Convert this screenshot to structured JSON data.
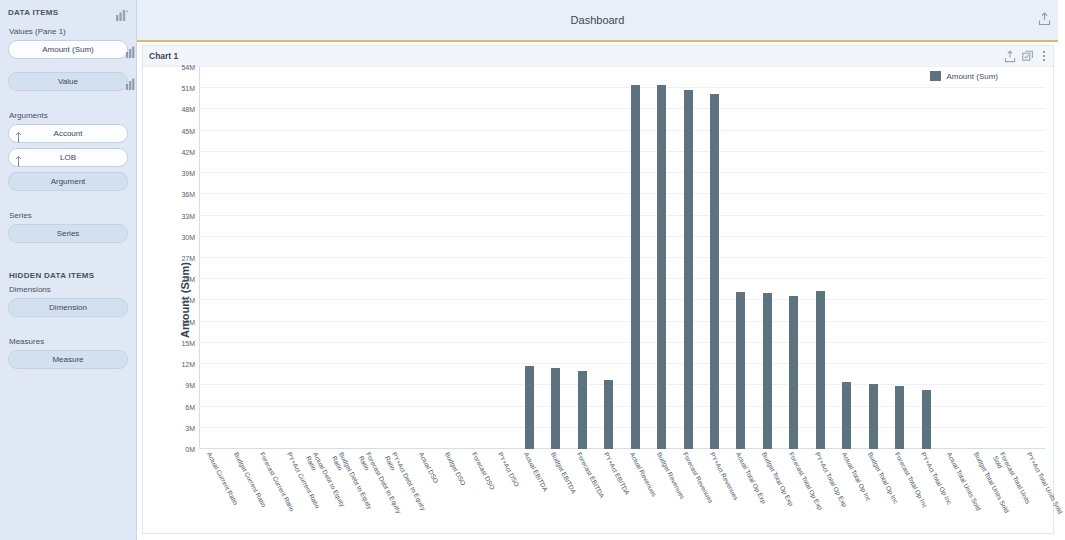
{
  "sidebar": {
    "title": "DATA ITEMS",
    "head_icon": "chart-bar-icon",
    "values_label": "Values (Pane 1)",
    "values_items": [
      {
        "label": "Amount (Sum)",
        "style": "filled",
        "icon": "chart-bar-icon"
      },
      {
        "label": "Value",
        "style": "ghost",
        "icon": "chart-bar-icon"
      }
    ],
    "arguments_label": "Arguments",
    "arguments_items": [
      {
        "label": "Account",
        "icon": "sort-asc-icon"
      },
      {
        "label": "LOB",
        "icon": "sort-asc-icon"
      }
    ],
    "arguments_placeholder": "Argument",
    "series_label": "Series",
    "series_placeholder": "Series",
    "hidden_title": "HIDDEN DATA ITEMS",
    "dimensions_label": "Dimensions",
    "dimensions_placeholder": "Dimension",
    "measures_label": "Measures",
    "measures_placeholder": "Measure"
  },
  "header": {
    "title": "Dashboard",
    "export_icon": "export-icon"
  },
  "chart_panel": {
    "caption": "Chart 1",
    "icons": [
      "export-icon",
      "multi-select-icon",
      "more-options-icon"
    ]
  },
  "colors": {
    "bar": "#5d7380",
    "sidebar_bg": "#dfe8f4",
    "topbar_bg": "#e8eff8",
    "accent_rule": "#d9b96b"
  },
  "chart_data": {
    "type": "bar",
    "title": "Chart 1",
    "xlabel": "",
    "ylabel": "Amount (Sum)",
    "ylim": [
      0,
      54000000
    ],
    "ytick_labels": [
      "0M",
      "3M",
      "6M",
      "9M",
      "12M",
      "15M",
      "18M",
      "21M",
      "24M",
      "27M",
      "30M",
      "33M",
      "36M",
      "39M",
      "42M",
      "45M",
      "48M",
      "51M",
      "54M"
    ],
    "ytick_values": [
      0,
      3000000,
      6000000,
      9000000,
      12000000,
      15000000,
      18000000,
      21000000,
      24000000,
      27000000,
      30000000,
      33000000,
      36000000,
      39000000,
      42000000,
      45000000,
      48000000,
      51000000,
      54000000
    ],
    "grid": true,
    "legend": {
      "position": "top-right",
      "entries": [
        "Amount (Sum)"
      ]
    },
    "series": [
      {
        "name": "Amount (Sum)",
        "color": "#5d7380"
      }
    ],
    "categories": [
      "Actual Current Ratio",
      "Budget Current Ratio",
      "Forecast Current Ratio",
      "PY+Act Current Ratio",
      "Actual Debt to Equity Ratio",
      "Budget Debt to Equity Ratio",
      "Forecast Debt to Equity Ratio",
      "PY+Act Debt to Equity Ratio",
      "Actual DSO",
      "Budget DSO",
      "Forecast DSO",
      "PY+Act DSO",
      "Actual EBITDA",
      "Budget EBITDA",
      "Forecast EBITDA",
      "PY+Act EBITDA",
      "Actual Revenues",
      "Budget Revenues",
      "Forecast Revenues",
      "PY+Act Revenues",
      "Actual Total Op Exp",
      "Budget Total Op Exp",
      "Forecast Total Op Exp",
      "PY+Act Total Op Exp",
      "Actual Total Op Inc",
      "Budget Total Op Inc",
      "Forecast Total Op Inc",
      "PY+Act Total Op Inc",
      "Actual Total Units Sold",
      "Budget Total Units Sold",
      "Forecast Total Units Sold",
      "PY+Act Total Units Sold"
    ],
    "values": [
      0,
      0,
      0,
      0,
      0,
      0,
      0,
      0,
      0,
      0,
      0,
      0,
      11700000,
      11400000,
      11000000,
      9800000,
      51400000,
      51400000,
      50800000,
      50200000,
      22200000,
      22000000,
      21600000,
      22300000,
      9500000,
      9200000,
      8900000,
      8300000,
      0,
      0,
      0,
      0
    ]
  }
}
